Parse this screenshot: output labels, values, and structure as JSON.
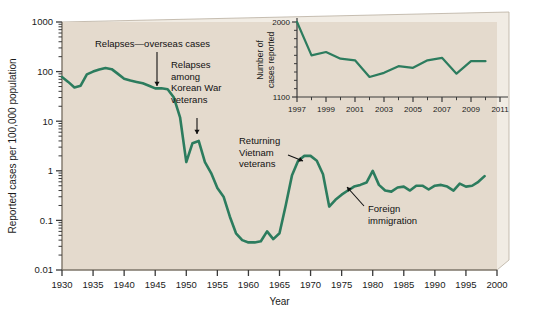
{
  "figure": {
    "panel_bg": "#e4dacd",
    "bevel_light": "#f1ece4",
    "bevel_dark": "#b9ae9f",
    "line_color": "#2c7c5e",
    "text_color": "#111111",
    "axis_color": "#7d7468"
  },
  "chart_data": {
    "type": "line",
    "title": "",
    "xlabel": "Year",
    "ylabel": "Reported cases per 100,000 population",
    "yscale": "log",
    "ylim": [
      0.01,
      1000
    ],
    "xlim": [
      1930,
      2000
    ],
    "grid": false,
    "legend": "none",
    "ytick_labels": [
      "1000",
      "100",
      "10",
      "1",
      "0.1",
      "0.01"
    ],
    "ytick_values": [
      1000,
      100,
      10,
      1,
      0.1,
      0.01
    ],
    "xtick_labels": [
      "1930",
      "1935",
      "1940",
      "1945",
      "1950",
      "1955",
      "1960",
      "1965",
      "1970",
      "1975",
      "1980",
      "1985",
      "1990",
      "1995",
      "2000"
    ],
    "xtick_values": [
      1930,
      1935,
      1940,
      1945,
      1950,
      1955,
      1960,
      1965,
      1970,
      1975,
      1980,
      1985,
      1990,
      1995,
      2000
    ],
    "series": [
      {
        "name": "Reported cases per 100,000 population",
        "color": "#2c7c5e",
        "x": [
          1930,
          1931,
          1932,
          1933,
          1934,
          1935,
          1936,
          1937,
          1938,
          1939,
          1940,
          1941,
          1942,
          1943,
          1944,
          1945,
          1946,
          1947,
          1948,
          1949,
          1950,
          1951,
          1952,
          1953,
          1954,
          1955,
          1956,
          1957,
          1958,
          1959,
          1960,
          1961,
          1962,
          1963,
          1964,
          1965,
          1966,
          1967,
          1968,
          1969,
          1970,
          1971,
          1972,
          1973,
          1974,
          1975,
          1976,
          1977,
          1978,
          1979,
          1980,
          1981,
          1982,
          1983,
          1984,
          1985,
          1986,
          1987,
          1988,
          1989,
          1990,
          1991,
          1992,
          1993,
          1994,
          1995,
          1996,
          1997,
          1998
        ],
        "y": [
          78,
          62,
          48,
          52,
          88,
          100,
          110,
          118,
          112,
          90,
          72,
          66,
          62,
          58,
          52,
          46,
          46,
          44,
          30,
          12,
          1.5,
          3.6,
          4.0,
          1.5,
          0.9,
          0.45,
          0.3,
          0.12,
          0.055,
          0.04,
          0.036,
          0.036,
          0.038,
          0.06,
          0.042,
          0.055,
          0.2,
          0.8,
          1.6,
          2.0,
          2.0,
          1.6,
          0.85,
          0.19,
          0.26,
          0.33,
          0.4,
          0.48,
          0.52,
          0.58,
          1.0,
          0.52,
          0.4,
          0.38,
          0.46,
          0.48,
          0.4,
          0.5,
          0.5,
          0.42,
          0.5,
          0.52,
          0.48,
          0.4,
          0.55,
          0.48,
          0.5,
          0.6,
          0.78
        ]
      }
    ],
    "annotations": [
      {
        "text": "Relapses—overseas cases",
        "name": "relapses-overseas-cases"
      },
      {
        "text": "Relapses among Korean War veterans",
        "lines": [
          "Relapses",
          "among",
          "Korean War",
          "veterans"
        ],
        "name": "relapses-korean-war-veterans"
      },
      {
        "text": "Returning Vietnam veterans",
        "lines": [
          "Returning",
          "Vietnam",
          "veterans"
        ],
        "name": "returning-vietnam-veterans"
      },
      {
        "text": "Foreign immigration",
        "lines": [
          "Foreign",
          "immigration"
        ],
        "name": "foreign-immigration"
      }
    ]
  },
  "inset_chart_data": {
    "type": "line",
    "title": "",
    "xlabel": "",
    "ylabel": "Number of cases reported",
    "yscale": "linear",
    "ylim": [
      1100,
      2000
    ],
    "xlim": [
      1997,
      2011
    ],
    "grid": false,
    "legend": "none",
    "ytick_labels": [
      "2000",
      "1100"
    ],
    "ytick_values": [
      2000,
      1100
    ],
    "xtick_labels": [
      "1997",
      "1999",
      "2001",
      "2003",
      "2005",
      "2007",
      "2009",
      "2011"
    ],
    "xtick_values": [
      1997,
      1999,
      2001,
      2003,
      2005,
      2007,
      2009,
      2011
    ],
    "series": [
      {
        "name": "Number of cases reported",
        "color": "#2c7c5e",
        "x": [
          1997,
          1998,
          1999,
          2000,
          2001,
          2002,
          2003,
          2004,
          2005,
          2006,
          2007,
          2008,
          2009,
          2010
        ],
        "y": [
          2000,
          1600,
          1640,
          1560,
          1540,
          1340,
          1390,
          1470,
          1450,
          1540,
          1570,
          1380,
          1530,
          1530
        ]
      }
    ]
  },
  "main_labels": {
    "ylabel": "Reported cases per 100,000 population",
    "xlabel": "Year"
  },
  "inset_labels": {
    "ylabel_line1": "Number of",
    "ylabel_line2": "cases reported"
  }
}
